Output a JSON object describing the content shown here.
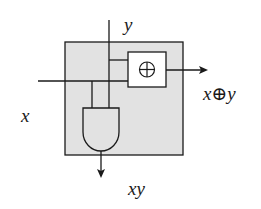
{
  "diagram": {
    "type": "reversible-logic-block",
    "block_fill": "#e2e2e2",
    "stroke_color": "#1a1a1a",
    "inputs": [
      {
        "label": "x"
      },
      {
        "label": "y"
      }
    ],
    "gates": [
      {
        "name": "xor",
        "symbol": "⊕"
      },
      {
        "name": "and"
      }
    ],
    "outputs": [
      {
        "label": "x⊕y"
      },
      {
        "label": "xy"
      }
    ]
  }
}
